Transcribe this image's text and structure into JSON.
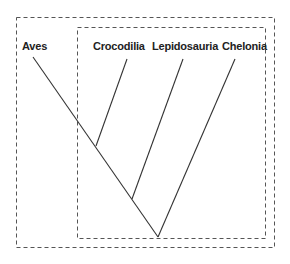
{
  "diagram": {
    "type": "cladogram",
    "taxa": [
      {
        "label": "Aves",
        "x": 22,
        "y": 40
      },
      {
        "label": "Crocodilia",
        "x": 93,
        "y": 40
      },
      {
        "label": "Lepidosauria",
        "x": 152,
        "y": 40
      },
      {
        "label": "Chelonia",
        "x": 222,
        "y": 40
      }
    ],
    "boxes": [
      {
        "name": "outer-box",
        "x": 16,
        "y": 17,
        "w": 258,
        "h": 230
      },
      {
        "name": "inner-box",
        "x": 77,
        "y": 27,
        "w": 188,
        "h": 211
      }
    ],
    "line_color": "#333333",
    "box_color": "#555555"
  }
}
